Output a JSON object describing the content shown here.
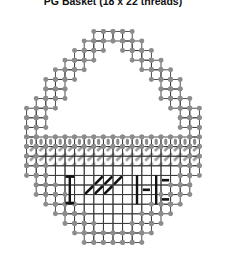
{
  "title": "PG Basket (18 x 22 threads)",
  "colors": {
    "grid_line": "#3a3a3a",
    "stitch_dot": "#8c8c8c",
    "hatch": "#9a9a9a",
    "motif": "#111111",
    "background": "#ffffff"
  },
  "chart_data": {
    "type": "table",
    "title": "PG Basket (18 x 22 threads)",
    "xlabel": "threads (width)",
    "ylabel": "threads (height)",
    "grid": true,
    "legend_position": "none",
    "canvas_width_threads": 18,
    "canvas_height_threads": 22,
    "cell_px": 9.6,
    "symbols": [
      {
        "name": "outline-stitch-dot",
        "glyph": "dot",
        "color": "#8c8c8c",
        "meaning": "overcast / edge stitch"
      },
      {
        "name": "diagonal-hatch",
        "glyph": "slash",
        "color": "#9a9a9a",
        "meaning": "slanted gobelin band"
      },
      {
        "name": "upright-bar",
        "glyph": "oval",
        "color": "#8c8c8c",
        "meaning": "upright straight stitch"
      },
      {
        "name": "motif-i",
        "glyph": "I",
        "color": "#111111",
        "meaning": "motif letter I"
      },
      {
        "name": "motif-slash",
        "glyph": "/",
        "color": "#111111",
        "meaning": "motif diagonal"
      },
      {
        "name": "motif-bracket",
        "glyph": "[",
        "color": "#111111",
        "meaning": "motif bracket"
      }
    ],
    "outline_rows": [
      {
        "row": 0,
        "start": 7,
        "end": 11
      },
      {
        "row": 1,
        "start": 6,
        "end": 12
      },
      {
        "row": 2,
        "start": 5,
        "end": 13
      },
      {
        "row": 3,
        "start": 4,
        "end": 14
      },
      {
        "row": 4,
        "start": 3,
        "end": 15
      },
      {
        "row": 5,
        "start": 2,
        "end": 16
      },
      {
        "row": 6,
        "start": 2,
        "end": 16
      },
      {
        "row": 7,
        "start": 1,
        "end": 17
      },
      {
        "row": 8,
        "start": 0,
        "end": 18
      },
      {
        "row": 9,
        "start": 0,
        "end": 18
      },
      {
        "row": 10,
        "start": 0,
        "end": 18
      },
      {
        "row": 11,
        "start": 0,
        "end": 18
      },
      {
        "row": 12,
        "start": 0,
        "end": 18
      },
      {
        "row": 13,
        "start": 0,
        "end": 18
      },
      {
        "row": 14,
        "start": 0,
        "end": 18
      },
      {
        "row": 15,
        "start": 1,
        "end": 17
      },
      {
        "row": 16,
        "start": 1,
        "end": 17
      },
      {
        "row": 17,
        "start": 2,
        "end": 16
      },
      {
        "row": 18,
        "start": 3,
        "end": 15
      },
      {
        "row": 19,
        "start": 4,
        "end": 14
      },
      {
        "row": 20,
        "start": 5,
        "end": 13
      },
      {
        "row": 21,
        "start": 6,
        "end": 12
      }
    ],
    "handle_opening_rows": [
      {
        "row": 1,
        "start": 8,
        "end": 10
      },
      {
        "row": 2,
        "start": 7,
        "end": 11
      },
      {
        "row": 3,
        "start": 6,
        "end": 12
      },
      {
        "row": 4,
        "start": 5,
        "end": 13
      },
      {
        "row": 5,
        "start": 4,
        "end": 14
      },
      {
        "row": 6,
        "start": 4,
        "end": 14
      },
      {
        "row": 7,
        "start": 3,
        "end": 15
      },
      {
        "row": 8,
        "start": 2,
        "end": 16
      },
      {
        "row": 9,
        "start": 2,
        "end": 16
      },
      {
        "row": 10,
        "start": 1,
        "end": 17
      }
    ],
    "band_upright_row": 11,
    "band_hatch_rows": [
      12,
      13
    ],
    "motif_cells": [
      {
        "type": "I",
        "col": 4,
        "row": 15
      },
      {
        "type": "I",
        "col": 4,
        "row": 16
      },
      {
        "type": "I",
        "col": 4,
        "row": 17
      },
      {
        "type": "slash",
        "col": 7,
        "row": 15
      },
      {
        "type": "slash",
        "col": 8,
        "row": 15
      },
      {
        "type": "slash",
        "col": 9,
        "row": 15
      },
      {
        "type": "slash",
        "col": 6,
        "row": 16
      },
      {
        "type": "slash",
        "col": 7,
        "row": 16
      },
      {
        "type": "slash",
        "col": 8,
        "row": 16
      },
      {
        "type": "bar",
        "col": 11,
        "row": 15
      },
      {
        "type": "bar",
        "col": 11,
        "row": 16
      },
      {
        "type": "bar",
        "col": 11,
        "row": 17
      },
      {
        "type": "dash",
        "col": 12,
        "row": 16
      },
      {
        "type": "bar",
        "col": 13,
        "row": 15
      },
      {
        "type": "bar",
        "col": 13,
        "row": 16
      },
      {
        "type": "bar",
        "col": 13,
        "row": 17
      },
      {
        "type": "dash",
        "col": 14,
        "row": 15
      },
      {
        "type": "dash",
        "col": 14,
        "row": 17
      }
    ]
  }
}
